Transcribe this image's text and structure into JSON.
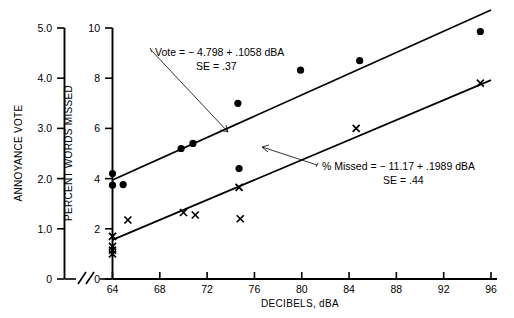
{
  "chart_data": {
    "type": "scatter",
    "title": "",
    "xlabel": "DECIBELS, dBA",
    "xlim": [
      64,
      96
    ],
    "xticks": [
      64,
      68,
      72,
      76,
      80,
      84,
      88,
      92,
      96
    ],
    "grid": false,
    "legend": "none",
    "axis_break": true,
    "axes": [
      {
        "id": "annoyance",
        "label": "ANNOYANCE VOTE",
        "position": "outer-left",
        "lim": [
          0,
          5.0
        ],
        "ticks": [
          0,
          1.0,
          2.0,
          3.0,
          4.0,
          5.0
        ],
        "ticklabels": [
          "0",
          "1.0",
          "2.0",
          "3.0",
          "4.0",
          "5.0"
        ]
      },
      {
        "id": "percent_missed",
        "label": "PERCENT WORDS MISSED",
        "position": "inner-left",
        "lim": [
          0,
          10
        ],
        "ticks": [
          0,
          2,
          4,
          6,
          8,
          10
        ],
        "ticklabels": [
          "0",
          "2",
          "4",
          "6",
          "8",
          "10"
        ]
      }
    ],
    "series": [
      {
        "name": "Annoyance Vote",
        "marker": "filled-circle",
        "axis": "annoyance",
        "points": [
          {
            "x": 64.0,
            "y": 2.1
          },
          {
            "x": 64.0,
            "y": 1.87
          },
          {
            "x": 64.9,
            "y": 1.88
          },
          {
            "x": 69.8,
            "y": 2.6
          },
          {
            "x": 70.8,
            "y": 2.7
          },
          {
            "x": 74.6,
            "y": 3.5
          },
          {
            "x": 74.7,
            "y": 2.2
          },
          {
            "x": 79.9,
            "y": 4.16
          },
          {
            "x": 84.9,
            "y": 4.35
          },
          {
            "x": 95.1,
            "y": 4.93
          }
        ]
      },
      {
        "name": "Percent Words Missed",
        "marker": "x-cross",
        "axis": "percent_missed",
        "points": [
          {
            "x": 64.0,
            "y": 1.7
          },
          {
            "x": 64.0,
            "y": 1.3
          },
          {
            "x": 64.0,
            "y": 1.15
          },
          {
            "x": 64.0,
            "y": 1.0
          },
          {
            "x": 65.3,
            "y": 2.35
          },
          {
            "x": 70.0,
            "y": 2.65
          },
          {
            "x": 71.0,
            "y": 2.55
          },
          {
            "x": 74.7,
            "y": 3.65
          },
          {
            "x": 74.8,
            "y": 2.4
          },
          {
            "x": 84.6,
            "y": 6.0
          },
          {
            "x": 95.1,
            "y": 7.8
          }
        ]
      }
    ],
    "fits": [
      {
        "name": "vote-fit",
        "axis": "annoyance",
        "intercept": -4.798,
        "slope": 0.1058,
        "se": 0.37,
        "x_start": 64.0,
        "x_end": 96.0,
        "equation": "Vote =  − 4.798 + .1058 dBA",
        "se_text": "SE =  .37"
      },
      {
        "name": "missed-fit",
        "axis": "percent_missed",
        "intercept": -11.17,
        "slope": 0.1989,
        "se": 0.44,
        "x_start": 64.0,
        "x_end": 96.0,
        "equation": "% Missed  =   − 11.17  +  .1989 dBA",
        "se_text": "SE  =  .44"
      }
    ]
  },
  "annotations": {
    "vote": {
      "line1": "Vote =  − 4.798 + .1058 dBA",
      "line2": "SE =  .37"
    },
    "missed": {
      "line1": "% Missed  =   − 11.17  +  .1989 dBA",
      "line2": "SE  =  .44"
    }
  },
  "labels": {
    "x_axis": "DECIBELS, dBA",
    "y_axis_outer": "ANNOYANCE VOTE",
    "y_axis_inner": "PERCENT WORDS MISSED"
  }
}
